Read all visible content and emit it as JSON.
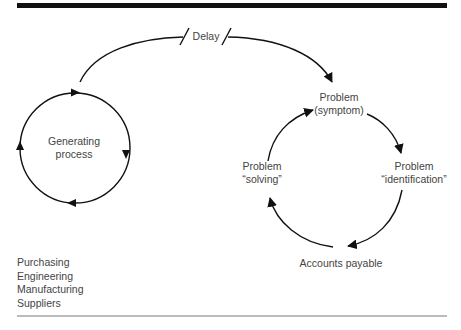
{
  "diagram": {
    "type": "causal-loop",
    "delay_label": "Delay",
    "left_loop": {
      "label_line1": "Generating",
      "label_line2": "process"
    },
    "right_loop": {
      "top": {
        "line1": "Problem",
        "line2": "(symptom)"
      },
      "right": {
        "line1": "Problem",
        "line2": "“identification”"
      },
      "left": {
        "line1": "Problem",
        "line2": "“solving”"
      },
      "bottom": {
        "line1": "Accounts payable"
      }
    },
    "departments": [
      "Purchasing",
      "Engineering",
      "Manufacturing",
      "Suppliers"
    ],
    "colors": {
      "stroke": "#111111",
      "text": "#444444",
      "rule": "#111111"
    }
  }
}
